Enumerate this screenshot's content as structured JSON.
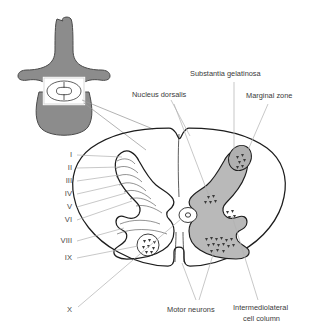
{
  "figure": {
    "background_color": "#ffffff",
    "vertebra_fill": "#8c8c8c",
    "vertebra_stroke": "#4a4a4a",
    "gray_matter_fill": "#b9b9b9",
    "gray_matter_stroke": "#1d1d1d",
    "cord_outline_color": "#1d1d1d",
    "leader_line_color": "#b0b0b0",
    "label_text_color": "#3a3a3a"
  },
  "inset": {
    "name": "vertebra-inset",
    "highlight_box_label": "spinal-cord-region"
  },
  "labels": {
    "nucleus_dorsalis": "Nucleus dorsalis",
    "substantia_gelatinosa": "Substantia gelatinosa",
    "marginal_zone": "Marginal zone",
    "motor_neurons": "Motor neurons",
    "intermediolateral_line1": "Intermediolateral",
    "intermediolateral_line2": "cell column"
  },
  "laminae": [
    {
      "numeral": "I",
      "x": 72,
      "y": 157
    },
    {
      "numeral": "II",
      "x": 72,
      "y": 170
    },
    {
      "numeral": "III",
      "x": 72,
      "y": 183
    },
    {
      "numeral": "IV",
      "x": 72,
      "y": 196
    },
    {
      "numeral": "V",
      "x": 72,
      "y": 209
    },
    {
      "numeral": "VI",
      "x": 72,
      "y": 222
    },
    {
      "numeral": "VIII",
      "x": 72,
      "y": 243
    },
    {
      "numeral": "IX",
      "x": 72,
      "y": 260
    },
    {
      "numeral": "X",
      "x": 72,
      "y": 312
    }
  ]
}
